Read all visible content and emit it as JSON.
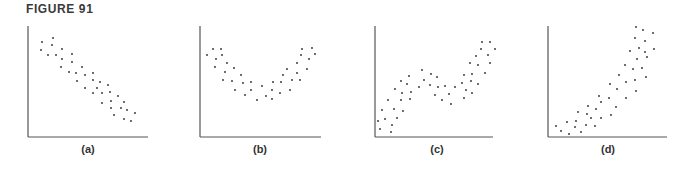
{
  "figure": {
    "title": "FIGURE 91"
  },
  "colors": {
    "axis": "#555555",
    "dot": "#2a2a2a",
    "label": "#333333"
  },
  "chart_data": [
    {
      "type": "scatter",
      "label": "(a)",
      "description": "Negative linear relationship",
      "axes": {
        "origin": [
          28,
          137
        ],
        "x_end": 148,
        "y_top": 26
      },
      "label_x": 88,
      "points": [
        [
          42,
          42
        ],
        [
          53,
          38
        ],
        [
          41,
          50
        ],
        [
          52,
          45
        ],
        [
          48,
          55
        ],
        [
          56,
          55
        ],
        [
          62,
          49
        ],
        [
          62,
          59
        ],
        [
          72,
          54
        ],
        [
          72,
          62
        ],
        [
          61,
          67
        ],
        [
          69,
          72
        ],
        [
          76,
          73
        ],
        [
          82,
          67
        ],
        [
          85,
          75
        ],
        [
          93,
          73
        ],
        [
          77,
          81
        ],
        [
          93,
          80
        ],
        [
          85,
          88
        ],
        [
          97,
          88
        ],
        [
          100,
          82
        ],
        [
          108,
          85
        ],
        [
          93,
          93
        ],
        [
          102,
          93
        ],
        [
          110,
          92
        ],
        [
          102,
          103
        ],
        [
          111,
          101
        ],
        [
          118,
          96
        ],
        [
          124,
          102
        ],
        [
          111,
          108
        ],
        [
          121,
          108
        ],
        [
          127,
          110
        ],
        [
          114,
          115
        ],
        [
          135,
          113
        ],
        [
          124,
          119
        ],
        [
          131,
          121
        ]
      ]
    },
    {
      "type": "scatter",
      "label": "(b)",
      "description": "U-shaped (quadratic) relationship",
      "axes": {
        "origin": [
          200,
          137
        ],
        "x_end": 321,
        "y_top": 26
      },
      "label_x": 260,
      "points": [
        [
          207,
          55
        ],
        [
          213,
          49
        ],
        [
          221,
          49
        ],
        [
          216,
          59
        ],
        [
          222,
          55
        ],
        [
          215,
          67
        ],
        [
          227,
          63
        ],
        [
          234,
          68
        ],
        [
          225,
          72
        ],
        [
          223,
          80
        ],
        [
          232,
          81
        ],
        [
          241,
          75
        ],
        [
          243,
          83
        ],
        [
          235,
          90
        ],
        [
          251,
          82
        ],
        [
          251,
          90
        ],
        [
          245,
          95
        ],
        [
          262,
          86
        ],
        [
          257,
          100
        ],
        [
          266,
          96
        ],
        [
          273,
          82
        ],
        [
          272,
          90
        ],
        [
          272,
          99
        ],
        [
          281,
          82
        ],
        [
          283,
          75
        ],
        [
          280,
          93
        ],
        [
          287,
          69
        ],
        [
          290,
          90
        ],
        [
          292,
          80
        ],
        [
          297,
          73
        ],
        [
          297,
          63
        ],
        [
          300,
          80
        ],
        [
          301,
          55
        ],
        [
          302,
          49
        ],
        [
          307,
          69
        ],
        [
          309,
          59
        ],
        [
          312,
          48
        ],
        [
          315,
          54
        ]
      ]
    },
    {
      "type": "scatter",
      "label": "(c)",
      "description": "Cubic (S-shaped) increasing relationship",
      "axes": {
        "origin": [
          375,
          137
        ],
        "x_end": 493,
        "y_top": 26
      },
      "label_x": 437,
      "points": [
        [
          378,
          121
        ],
        [
          380,
          129
        ],
        [
          382,
          110
        ],
        [
          385,
          119
        ],
        [
          391,
          132
        ],
        [
          392,
          125
        ],
        [
          388,
          100
        ],
        [
          394,
          109
        ],
        [
          397,
          118
        ],
        [
          395,
          89
        ],
        [
          401,
          100
        ],
        [
          403,
          111
        ],
        [
          402,
          93
        ],
        [
          401,
          81
        ],
        [
          407,
          84
        ],
        [
          409,
          76
        ],
        [
          410,
          99
        ],
        [
          411,
          92
        ],
        [
          419,
          87
        ],
        [
          422,
          70
        ],
        [
          424,
          80
        ],
        [
          430,
          85
        ],
        [
          431,
          74
        ],
        [
          435,
          95
        ],
        [
          437,
          77
        ],
        [
          438,
          87
        ],
        [
          442,
          100
        ],
        [
          445,
          86
        ],
        [
          449,
          94
        ],
        [
          451,
          104
        ],
        [
          455,
          87
        ],
        [
          462,
          83
        ],
        [
          464,
          75
        ],
        [
          464,
          98
        ],
        [
          466,
          90
        ],
        [
          471,
          81
        ],
        [
          470,
          63
        ],
        [
          472,
          74
        ],
        [
          472,
          93
        ],
        [
          476,
          56
        ],
        [
          478,
          65
        ],
        [
          478,
          84
        ],
        [
          481,
          49
        ],
        [
          482,
          42
        ],
        [
          485,
          73
        ],
        [
          488,
          55
        ],
        [
          490,
          42
        ],
        [
          490,
          63
        ],
        [
          495,
          49
        ]
      ]
    },
    {
      "type": "scatter",
      "label": "(d)",
      "description": "Exponential (convex) increasing relationship",
      "axes": {
        "origin": [
          548,
          137
        ],
        "x_end": 667,
        "y_top": 26
      },
      "label_x": 608,
      "points": [
        [
          556,
          126
        ],
        [
          561,
          131
        ],
        [
          567,
          122
        ],
        [
          569,
          134
        ],
        [
          575,
          127
        ],
        [
          576,
          121
        ],
        [
          581,
          132
        ],
        [
          578,
          112
        ],
        [
          586,
          125
        ],
        [
          587,
          114
        ],
        [
          588,
          106
        ],
        [
          591,
          118
        ],
        [
          595,
          126
        ],
        [
          596,
          109
        ],
        [
          599,
          96
        ],
        [
          601,
          118
        ],
        [
          601,
          102
        ],
        [
          609,
          98
        ],
        [
          611,
          115
        ],
        [
          610,
          84
        ],
        [
          616,
          107
        ],
        [
          617,
          89
        ],
        [
          619,
          75
        ],
        [
          626,
          98
        ],
        [
          625,
          65
        ],
        [
          626,
          82
        ],
        [
          630,
          51
        ],
        [
          633,
          69
        ],
        [
          635,
          80
        ],
        [
          636,
          91
        ],
        [
          635,
          38
        ],
        [
          636,
          27
        ],
        [
          637,
          59
        ],
        [
          639,
          48
        ],
        [
          642,
          68
        ],
        [
          643,
          30
        ],
        [
          645,
          41
        ],
        [
          645,
          52
        ],
        [
          646,
          77
        ],
        [
          647,
          57
        ],
        [
          653,
          33
        ],
        [
          654,
          49
        ]
      ]
    }
  ]
}
